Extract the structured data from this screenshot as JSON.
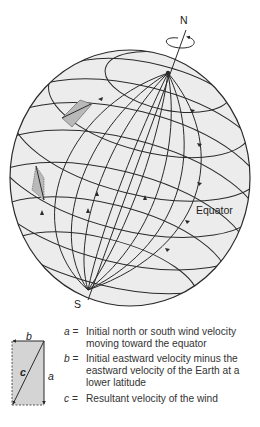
{
  "labels": {
    "north": "N",
    "south": "S",
    "equator": "Equator"
  },
  "vector_diagram": {
    "a": "a",
    "b": "b",
    "c": "c"
  },
  "legend": [
    {
      "key": "a",
      "eq": " =",
      "text": "Initial north or south wind velocity moving toward the equator"
    },
    {
      "key": "b",
      "eq": " =",
      "text": "Initial eastward velocity minus the eastward velocity of the Earth at a lower latitude"
    },
    {
      "key": "c",
      "eq": " =",
      "text": "Resultant velocity of the wind"
    }
  ],
  "colors": {
    "globe_fill": "#ececec",
    "line": "#2a2a2a",
    "shade": "#b9b9b9"
  }
}
